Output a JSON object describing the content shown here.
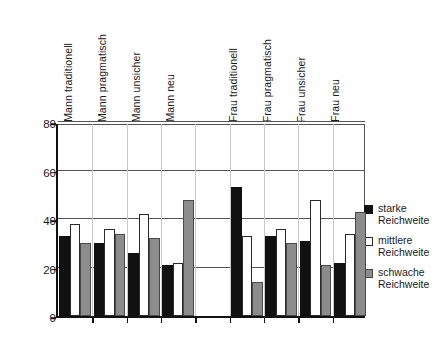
{
  "chart_data": {
    "type": "bar",
    "title": "",
    "subtitle": "",
    "xlabel": "",
    "ylabel": "",
    "ylim": [
      0,
      80
    ],
    "yticks": [
      0,
      20,
      40,
      60,
      80
    ],
    "grid": "horizontal-and-vertical",
    "legend_position": "right",
    "categories": [
      "Mann traditionell",
      "Mann pragmatisch",
      "Mann unsicher",
      "Mann neu",
      "Frau traditionell",
      "Frau pragmatisch",
      "Frau unsicher",
      "Frau neu"
    ],
    "series": [
      {
        "name": "starke Reichweite",
        "color": "#111111",
        "values": [
          33,
          30,
          26,
          21,
          53,
          33,
          31,
          22
        ]
      },
      {
        "name": "mittlere Reichweite",
        "color": "#ffffff",
        "values": [
          38,
          36,
          42,
          22,
          33,
          36,
          48,
          34
        ]
      },
      {
        "name": "schwache Reichweite",
        "color": "#8c8c8c",
        "values": [
          30,
          34,
          32,
          48,
          14,
          30,
          21,
          43
        ]
      }
    ]
  },
  "legend": {
    "items": [
      {
        "line1": "starke",
        "line2": "Reichweite",
        "swatch": "black-square-icon"
      },
      {
        "line1": "mittlere",
        "line2": "Reichweite",
        "swatch": "white-square-icon"
      },
      {
        "line1": "schwache",
        "line2": "Reichweite",
        "swatch": "gray-square-icon"
      }
    ]
  },
  "axis": {
    "y_tick_labels": [
      "80",
      "60",
      "40",
      "20",
      "0"
    ]
  }
}
